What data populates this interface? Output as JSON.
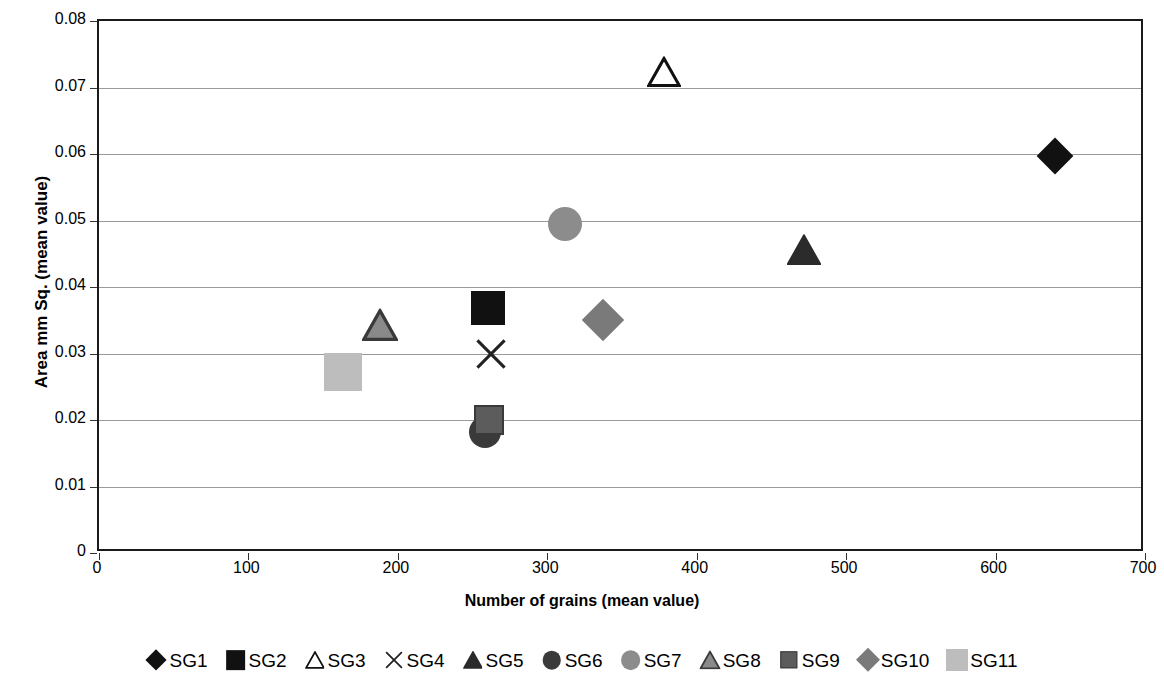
{
  "chart_data": {
    "type": "scatter",
    "title": "",
    "xlabel": "Number of grains (mean value)",
    "ylabel": "Area mm Sq. (mean value)",
    "xlim": [
      0,
      700
    ],
    "ylim": [
      0,
      0.08
    ],
    "xticks": [
      "0",
      "100",
      "200",
      "300",
      "400",
      "500",
      "600",
      "700"
    ],
    "xtick_values": [
      0,
      100,
      200,
      300,
      400,
      500,
      600,
      700
    ],
    "yticks": [
      "0",
      "0.01",
      "0.02",
      "0.03",
      "0.04",
      "0.05",
      "0.06",
      "0.07",
      "0.08"
    ],
    "ytick_values": [
      0,
      0.01,
      0.02,
      0.03,
      0.04,
      0.05,
      0.06,
      0.07,
      0.08
    ],
    "grid": "horizontal",
    "legend_position": "bottom",
    "series": [
      {
        "name": "SG1",
        "marker": "diamond",
        "fill": "#111111",
        "edge": "#111111",
        "size": 26,
        "x": 640,
        "y": 0.0597
      },
      {
        "name": "SG2",
        "marker": "square",
        "fill": "#111111",
        "edge": "#111111",
        "size": 34,
        "x": 260,
        "y": 0.0368
      },
      {
        "name": "SG3",
        "marker": "triangle",
        "fill": "#ffffff",
        "edge": "#111111",
        "size": 34,
        "x": 378,
        "y": 0.0724
      },
      {
        "name": "SG4",
        "marker": "x",
        "fill": "#222222",
        "edge": "#222222",
        "size": 34,
        "x": 262,
        "y": 0.03
      },
      {
        "name": "SG5",
        "marker": "triangle",
        "fill": "#2b2b2b",
        "edge": "#2b2b2b",
        "size": 34,
        "x": 472,
        "y": 0.0455
      },
      {
        "name": "SG6",
        "marker": "circle",
        "fill": "#3a3a3a",
        "edge": "#3a3a3a",
        "size": 32,
        "x": 258,
        "y": 0.0182
      },
      {
        "name": "SG7",
        "marker": "circle",
        "fill": "#8c8c8c",
        "edge": "#8c8c8c",
        "size": 34,
        "x": 312,
        "y": 0.0495
      },
      {
        "name": "SG8",
        "marker": "triangle",
        "fill": "#8a8a8a",
        "edge": "#3a3a3a",
        "size": 36,
        "x": 188,
        "y": 0.0343
      },
      {
        "name": "SG9",
        "marker": "square",
        "fill": "#5c5c5c",
        "edge": "#3a3a3a",
        "size": 30,
        "x": 261,
        "y": 0.02
      },
      {
        "name": "SG10",
        "marker": "diamond",
        "fill": "#7a7a7a",
        "edge": "#7a7a7a",
        "size": 30,
        "x": 337,
        "y": 0.035
      },
      {
        "name": "SG11",
        "marker": "square",
        "fill": "#bdbdbd",
        "edge": "#bdbdbd",
        "size": 38,
        "x": 163,
        "y": 0.0272
      }
    ]
  },
  "legend": {
    "entries": [
      "SG1",
      "SG2",
      "SG3",
      "SG4",
      "SG5",
      "SG6",
      "SG7",
      "SG8",
      "SG9",
      "SG10",
      "SG11"
    ]
  },
  "colors": {
    "axis": "#1a1a1a",
    "grid": "#9a9a9a",
    "background": "#ffffff",
    "text": "#000000"
  }
}
